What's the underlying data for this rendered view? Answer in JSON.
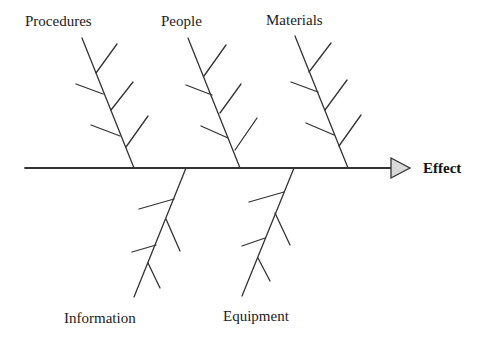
{
  "diagram": {
    "type": "fishbone",
    "effect": {
      "label": "Effect"
    },
    "categories": [
      {
        "label": "Procedures",
        "position": "top",
        "causes": 5
      },
      {
        "label": "People",
        "position": "top",
        "causes": 5
      },
      {
        "label": "Materials",
        "position": "top",
        "causes": 5
      },
      {
        "label": "Information",
        "position": "bottom",
        "causes": 4
      },
      {
        "label": "Equipment",
        "position": "bottom",
        "causes": 4
      }
    ],
    "colors": {
      "line": "#333333",
      "arrow_fill": "#d9d9d9",
      "text": "#222222",
      "background": "#ffffff"
    }
  }
}
